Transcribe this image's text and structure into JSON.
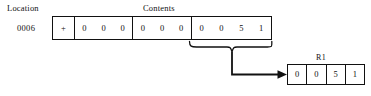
{
  "figure": {
    "labels": {
      "location": "Location",
      "contents": "Contents",
      "register_name": "R1"
    },
    "address": "0006",
    "memory_word": {
      "sign": "+",
      "groups": [
        {
          "name": "digits-1",
          "digits": [
            "0",
            "0",
            "0"
          ]
        },
        {
          "name": "digits-2",
          "digits": [
            "0",
            "0",
            "0"
          ]
        },
        {
          "name": "digits-3",
          "digits": [
            "0",
            "0",
            "5",
            "1"
          ]
        }
      ]
    },
    "register": {
      "name": "R1",
      "cells": [
        "0",
        "0",
        "5",
        "1"
      ]
    },
    "colors": {
      "ink": "#111111",
      "background": "#ffffff"
    }
  }
}
